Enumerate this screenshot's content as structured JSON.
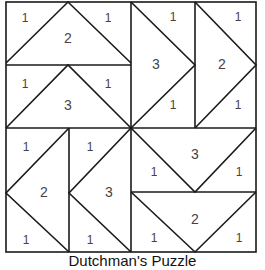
{
  "diagram": {
    "caption": "Dutchman's Puzzle",
    "colors": {
      "line": "#1a1a1a",
      "label": "#444444",
      "background": "#ffffff"
    },
    "blocks": [
      {
        "name": "top-left-upper",
        "big": "2",
        "small": [
          "1",
          "1"
        ]
      },
      {
        "name": "top-left-lower",
        "big": "3",
        "small": [
          "1",
          "1"
        ]
      },
      {
        "name": "top-right-left",
        "big": "3",
        "small": [
          "1",
          "1"
        ]
      },
      {
        "name": "top-right-right",
        "big": "2",
        "small": [
          "1",
          "1"
        ]
      },
      {
        "name": "bottom-left-left",
        "big": "2",
        "small": [
          "1",
          "1"
        ]
      },
      {
        "name": "bottom-left-right",
        "big": "3",
        "small": [
          "1",
          "1"
        ]
      },
      {
        "name": "bottom-right-upper",
        "big": "3",
        "small": [
          "1",
          "1"
        ]
      },
      {
        "name": "bottom-right-lower",
        "big": "2",
        "small": [
          "1",
          "1"
        ]
      }
    ]
  }
}
